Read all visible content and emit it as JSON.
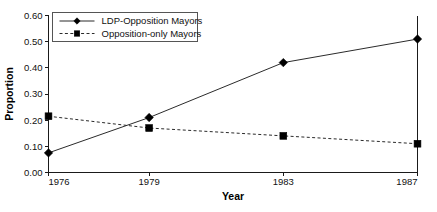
{
  "chart_data": {
    "type": "line",
    "title": "",
    "xlabel": "Year",
    "ylabel": "Proportion",
    "x": [
      1976,
      1979,
      1983,
      1987
    ],
    "xtick_labels": [
      "1976",
      "1979",
      "1983",
      "1987"
    ],
    "xlim": [
      1976,
      1987
    ],
    "ylim": [
      0.0,
      0.6
    ],
    "ytick_labels": [
      "0.00",
      "0.10",
      "0.20",
      "0.30",
      "0.40",
      "0.50",
      "0.60"
    ],
    "ytick_values": [
      0.0,
      0.1,
      0.2,
      0.3,
      0.4,
      0.5,
      0.6
    ],
    "grid": false,
    "legend_position": "top-left",
    "series": [
      {
        "name": "LDP-Opposition Mayors",
        "values": [
          0.075,
          0.21,
          0.42,
          0.51
        ],
        "marker": "diamond",
        "line_style": "solid",
        "color": "#000000"
      },
      {
        "name": "Opposition-only Mayors",
        "values": [
          0.215,
          0.17,
          0.14,
          0.11
        ],
        "marker": "square",
        "line_style": "dashed",
        "color": "#000000"
      }
    ]
  },
  "legend": {
    "entries": [
      {
        "label": "LDP-Opposition Mayors"
      },
      {
        "label": "Opposition-only Mayors"
      }
    ]
  },
  "axes": {
    "y_title": "Proportion",
    "x_title": "Year"
  }
}
